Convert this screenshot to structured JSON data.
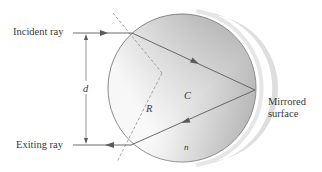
{
  "figure": {
    "labels": {
      "incident_ray": "Incident ray",
      "exiting_ray": "Exiting ray",
      "mirrored_surface_line1": "Mirrored",
      "mirrored_surface_line2": "surface",
      "distance": "d",
      "radius": "R",
      "center": "C",
      "index": "n"
    },
    "colors": {
      "sphere_light": "#f4f4f4",
      "sphere_dark": "#a9a9a9",
      "ray": "#5a5a5a",
      "normal_dashed": "#9a9a9a",
      "mirror_band": "#dcdcdc",
      "outline": "#6b6b6b",
      "text": "#3a3a3a"
    },
    "geometry": {
      "sphere_center": [
        182,
        88
      ],
      "sphere_radius": 74,
      "entry_point": [
        132,
        33
      ],
      "reflection_point": [
        255,
        90
      ],
      "exit_point": [
        131,
        145
      ],
      "center_C": [
        162,
        73
      ]
    }
  }
}
